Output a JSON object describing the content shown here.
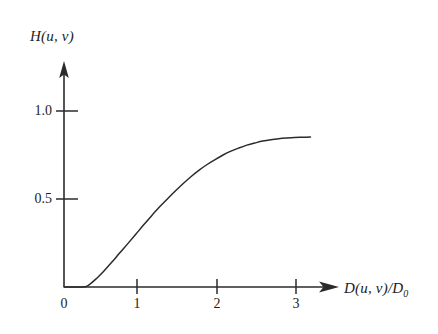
{
  "figure": {
    "background_color": "#ffffff",
    "line_color": "#2b2b2b",
    "axis_color": "#2b2b2b"
  },
  "axes": {
    "y_label": "H(u, v)",
    "x_label_main": "D(u, v)/D",
    "x_label_sub": "0",
    "origin_label": "0"
  },
  "chart_data": {
    "type": "line",
    "title": "",
    "xlabel": "D(u, v)/D0",
    "ylabel": "H(u, v)",
    "xlim": [
      0,
      3.4
    ],
    "ylim": [
      0,
      1.15
    ],
    "grid": false,
    "legend": null,
    "x_ticks": [
      0,
      1,
      2,
      3
    ],
    "x_tick_labels": [
      "0",
      "1",
      "2",
      "3"
    ],
    "y_ticks": [
      0.5,
      1.0
    ],
    "y_tick_labels": [
      "0.5",
      "1.0"
    ],
    "series": [
      {
        "name": "H(u, v)",
        "x": [
          0.0,
          0.1,
          0.2,
          0.29,
          0.4,
          0.5,
          0.6,
          0.7,
          0.8,
          0.9,
          1.0,
          1.1,
          1.2,
          1.3,
          1.4,
          1.5,
          1.6,
          1.7,
          1.8,
          1.9,
          2.0,
          2.1,
          2.2,
          2.3,
          2.4,
          2.5,
          2.6,
          2.7,
          2.8,
          2.9,
          3.0,
          3.1
        ],
        "y": [
          0.0,
          0.0,
          0.0,
          0.005,
          0.045,
          0.09,
          0.14,
          0.193,
          0.245,
          0.298,
          0.352,
          0.404,
          0.454,
          0.5,
          0.545,
          0.588,
          0.628,
          0.664,
          0.696,
          0.724,
          0.75,
          0.772,
          0.79,
          0.806,
          0.818,
          0.829,
          0.837,
          0.843,
          0.847,
          0.85,
          0.851,
          0.852
        ]
      }
    ]
  }
}
